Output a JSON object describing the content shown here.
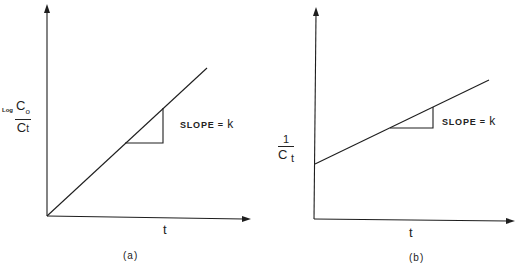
{
  "panels": [
    {
      "id": "a",
      "caption": "(a)",
      "x_axis_label": "t",
      "y_axis_label": {
        "prefix": "Log",
        "numerator": "C0",
        "denominator": "Ct"
      },
      "slope_annotation": "SLOPE = k",
      "slope_prefix": "SLOPE = ",
      "slope_symbol": "k",
      "line": {
        "start": "origin",
        "intercept": 0,
        "description": "straight line through origin"
      }
    },
    {
      "id": "b",
      "caption": "(b)",
      "x_axis_label": "t",
      "y_axis_label": {
        "numerator": "1",
        "denominator": "Ct"
      },
      "slope_annotation": "SLOPE = k",
      "slope_prefix": "SLOPE = ",
      "slope_symbol": "k",
      "line": {
        "start": "positive y-intercept",
        "description": "straight line with positive intercept"
      }
    }
  ],
  "colors": {
    "ink": "#1e1e1e",
    "background": "#ffffff"
  }
}
